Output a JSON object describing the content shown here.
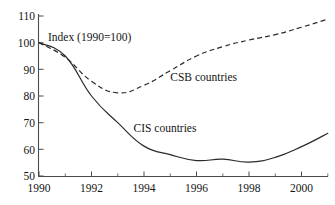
{
  "chart_data": {
    "type": "line",
    "title": "",
    "subtitle": "",
    "annotation_index": "Index (1990=100)",
    "xlabel": "",
    "ylabel": "",
    "xlim": [
      1990,
      2001
    ],
    "ylim": [
      50,
      110
    ],
    "grid": false,
    "legend_position": "inline-labels",
    "y_ticks": [
      50,
      60,
      70,
      80,
      90,
      100,
      110
    ],
    "y_tick_labels": [
      "50",
      "60",
      "70",
      "80",
      "90",
      "100",
      "110"
    ],
    "x_ticks": [
      1990,
      1992,
      1994,
      1996,
      1998,
      2000
    ],
    "x_tick_labels": [
      "1990",
      "1992",
      "1994",
      "1996",
      "1998",
      "2000"
    ],
    "x_minor_ticks": [
      1991,
      1993,
      1995,
      1997,
      1999,
      2001
    ],
    "x": [
      1990,
      1991,
      1992,
      1993,
      1994,
      1995,
      1996,
      1997,
      1998,
      1999,
      2000,
      2001
    ],
    "series": [
      {
        "name": "CSB countries",
        "style": "dashed",
        "label": "CSB countries",
        "label_x": 1995.0,
        "label_y": 85.5,
        "values": [
          100,
          94.5,
          85.5,
          81.2,
          84.0,
          89.5,
          95.0,
          98.5,
          101.0,
          103.0,
          105.8,
          108.8
        ]
      },
      {
        "name": "CIS countries",
        "style": "solid",
        "label": "CIS countries",
        "label_x": 1993.6,
        "label_y": 66.5,
        "values": [
          100,
          95.0,
          80.0,
          70.0,
          61.2,
          58.0,
          55.8,
          56.3,
          55.2,
          57.0,
          61.0,
          66.0
        ]
      }
    ]
  },
  "labels": {
    "index_note": "Index (1990=100)",
    "csb": "CSB countries",
    "cis": "CIS countries"
  }
}
